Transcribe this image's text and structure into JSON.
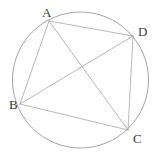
{
  "figure": {
    "width": 160,
    "height": 164,
    "background_color": "#ffffff",
    "line_color": "#a6a6a6",
    "circle_color": "#9a9a9a",
    "label_color": "#3a3a3a",
    "line_width": 0.8,
    "circle_width": 0.9
  },
  "circle": {
    "name": "circumscribed-circle",
    "cx": 80.5,
    "cy": 80.0,
    "r": 68.0
  },
  "points": [
    {
      "id": "A",
      "label": "A",
      "x": 49.0,
      "y": 21.0,
      "label_x": 42,
      "label_y": 6
    },
    {
      "id": "D",
      "label": "D",
      "x": 133.0,
      "y": 36.0,
      "label_x": 138,
      "label_y": 25
    },
    {
      "id": "B",
      "label": "B",
      "x": 20.0,
      "y": 104.0,
      "label_x": 9,
      "label_y": 98
    },
    {
      "id": "C",
      "label": "C",
      "x": 128.0,
      "y": 130.0,
      "label_x": 133,
      "label_y": 132
    }
  ],
  "segments": [
    {
      "id": "AB",
      "name": "side-ab",
      "x1": 49.0,
      "y1": 21.0,
      "x2": 20.0,
      "y2": 104.0
    },
    {
      "id": "AD",
      "name": "side-ad",
      "x1": 49.0,
      "y1": 21.0,
      "x2": 133.0,
      "y2": 36.0
    },
    {
      "id": "BC",
      "name": "side-bc",
      "x1": 20.0,
      "y1": 104.0,
      "x2": 128.0,
      "y2": 130.0
    },
    {
      "id": "DC",
      "name": "side-dc",
      "x1": 133.0,
      "y1": 36.0,
      "x2": 128.0,
      "y2": 130.0
    },
    {
      "id": "AC",
      "name": "diagonal-ac",
      "x1": 49.0,
      "y1": 21.0,
      "x2": 128.0,
      "y2": 130.0
    },
    {
      "id": "BD",
      "name": "diagonal-bd",
      "x1": 20.0,
      "y1": 104.0,
      "x2": 133.0,
      "y2": 36.0
    }
  ]
}
